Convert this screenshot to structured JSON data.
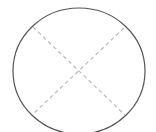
{
  "diagram": {
    "shape": "circle-with-cross",
    "circle": {
      "cx": 79,
      "cy": 71,
      "rx": 66,
      "ry": 63,
      "stroke": "#555555"
    },
    "cross_lines": [
      {
        "x1": 33,
        "y1": 27,
        "x2": 125,
        "y2": 115
      },
      {
        "x1": 124,
        "y1": 28,
        "x2": 33,
        "y2": 114
      }
    ],
    "cross_color": "#bbbbbb"
  }
}
